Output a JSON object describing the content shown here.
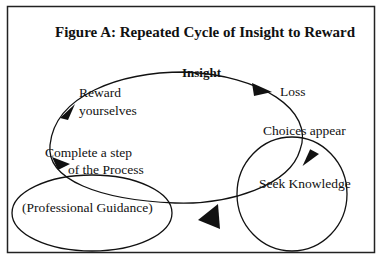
{
  "title": "Figure A:  Repeated Cycle of Insight to Reward",
  "nodes": {
    "insight": "Insight",
    "loss": "Loss",
    "reward_line1": "Reward",
    "reward_line2": "yourselves",
    "choices": "Choices appear",
    "complete_line1": "Complete a step",
    "complete_line2": "of the Process",
    "seek": "Seek Knowledge",
    "guidance": "(Professional Guidance)"
  },
  "colors": {
    "stroke": "#111111",
    "background": "#ffffff"
  }
}
